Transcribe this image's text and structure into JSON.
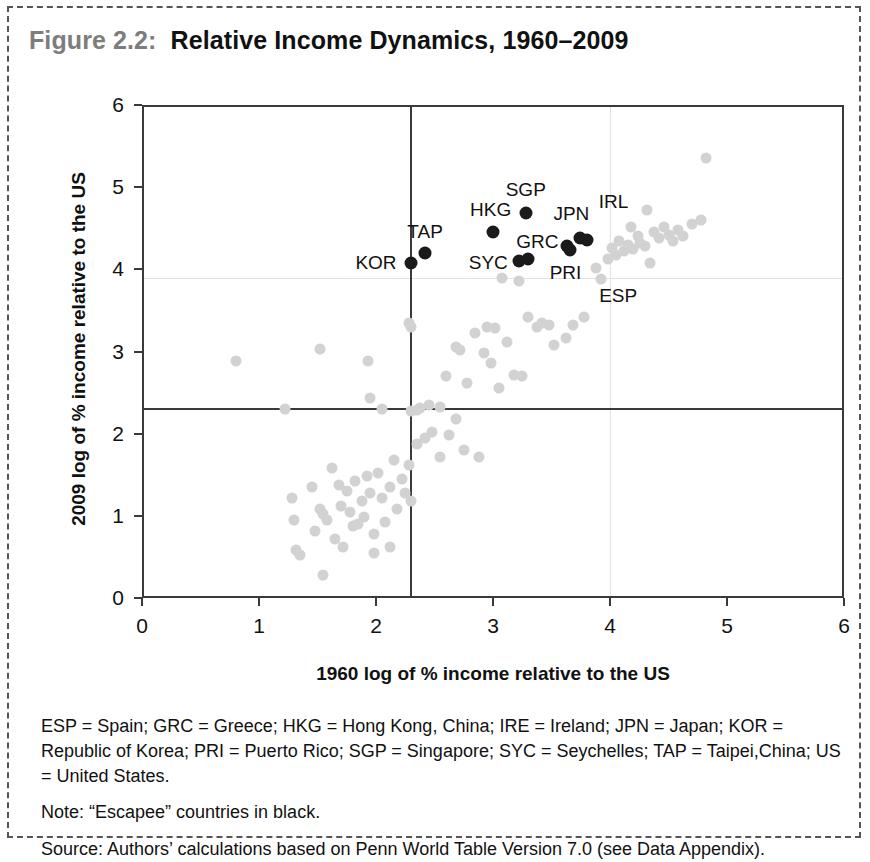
{
  "figure": {
    "number": "Figure 2.2:",
    "title": "Relative Income Dynamics, 1960–2009"
  },
  "notes": {
    "abbreviations": "ESP = Spain; GRC = Greece; HKG = Hong Kong, China; IRE = Ireland; JPN = Japan; KOR = Republic of Korea; PRI = Puerto Rico; SGP = Singapore; SYC = Seychelles; TAP = Taipei,China; US = United States.",
    "note": "Note: “Escapee” countries in black.",
    "source": "Source: Authors’ calculations based on Penn World Table Version 7.0 (see Data Appendix)."
  },
  "chart_data": {
    "type": "scatter",
    "title": "Relative Income Dynamics, 1960–2009",
    "xlabel": "1960 log of % income relative to the US",
    "ylabel": "2009 log of % income relative to the US",
    "xlim": [
      0,
      6
    ],
    "ylim": [
      0,
      6
    ],
    "xticks": [
      0,
      1,
      2,
      3,
      4,
      5,
      6
    ],
    "yticks": [
      0,
      1,
      2,
      3,
      4,
      5,
      6
    ],
    "grid": true,
    "legend": "none",
    "colors": {
      "escapee": "#1a1a1a",
      "other": "#d2d2d2",
      "axis": "#3a3a3a",
      "gridline": "#e2e2e2",
      "title_number": "#7d7d7d"
    },
    "reference_lines": [
      {
        "orientation": "vertical",
        "value": 2.3,
        "style": "solid",
        "color": "#3a3a3a"
      },
      {
        "orientation": "horizontal",
        "value": 2.3,
        "style": "solid",
        "color": "#3a3a3a"
      }
    ],
    "gridlines": [
      {
        "orientation": "vertical",
        "value": 4.0
      },
      {
        "orientation": "horizontal",
        "value": 3.9
      }
    ],
    "series": [
      {
        "name": "Escapee countries",
        "color": "#1a1a1a",
        "marker": "filled-circle",
        "points": [
          {
            "label": "KOR",
            "x": 2.3,
            "y": 4.08
          },
          {
            "label": "TAP",
            "x": 2.42,
            "y": 4.2
          },
          {
            "label": "HKG",
            "x": 3.0,
            "y": 4.45
          },
          {
            "label": "SGP",
            "x": 3.28,
            "y": 4.68
          },
          {
            "label": "SYC",
            "x": 3.22,
            "y": 4.1
          },
          {
            "label": "SYC",
            "x": 3.3,
            "y": 4.12
          },
          {
            "label": "GRC",
            "x": 3.63,
            "y": 4.29
          },
          {
            "label": "PRI",
            "x": 3.66,
            "y": 4.23
          },
          {
            "label": "JPN",
            "x": 3.74,
            "y": 4.38
          },
          {
            "label": "JPN",
            "x": 3.8,
            "y": 4.36
          }
        ]
      },
      {
        "name": "Other countries",
        "color": "#d2d2d2",
        "marker": "filled-circle",
        "points": [
          {
            "x": 0.8,
            "y": 2.88
          },
          {
            "x": 1.22,
            "y": 2.3
          },
          {
            "x": 1.52,
            "y": 3.03
          },
          {
            "x": 1.55,
            "y": 0.28
          },
          {
            "x": 1.93,
            "y": 2.88
          },
          {
            "x": 1.95,
            "y": 2.44
          },
          {
            "x": 2.05,
            "y": 2.3
          },
          {
            "x": 2.28,
            "y": 3.35
          },
          {
            "x": 2.3,
            "y": 3.3
          },
          {
            "x": 2.3,
            "y": 2.28
          },
          {
            "x": 2.35,
            "y": 2.29
          },
          {
            "x": 2.38,
            "y": 2.31
          },
          {
            "x": 2.45,
            "y": 2.35
          },
          {
            "x": 2.55,
            "y": 2.33
          },
          {
            "x": 2.6,
            "y": 2.7
          },
          {
            "x": 2.68,
            "y": 3.05
          },
          {
            "x": 2.72,
            "y": 3.02
          },
          {
            "x": 2.78,
            "y": 2.62
          },
          {
            "x": 2.85,
            "y": 3.22
          },
          {
            "x": 2.88,
            "y": 1.72
          },
          {
            "x": 2.92,
            "y": 2.98
          },
          {
            "x": 2.95,
            "y": 3.3
          },
          {
            "x": 2.98,
            "y": 2.86
          },
          {
            "x": 3.02,
            "y": 3.28
          },
          {
            "x": 3.05,
            "y": 2.55
          },
          {
            "x": 3.08,
            "y": 3.9
          },
          {
            "x": 3.12,
            "y": 3.12
          },
          {
            "x": 3.18,
            "y": 2.72
          },
          {
            "x": 3.22,
            "y": 3.86
          },
          {
            "x": 3.25,
            "y": 2.7
          },
          {
            "x": 3.3,
            "y": 3.42
          },
          {
            "x": 3.38,
            "y": 3.3
          },
          {
            "x": 3.42,
            "y": 3.35
          },
          {
            "x": 3.48,
            "y": 3.32
          },
          {
            "x": 3.52,
            "y": 3.08
          },
          {
            "x": 3.62,
            "y": 3.16
          },
          {
            "x": 3.68,
            "y": 3.32
          },
          {
            "x": 3.78,
            "y": 3.42
          },
          {
            "x": 3.88,
            "y": 4.02
          },
          {
            "x": 3.92,
            "y": 3.88
          },
          {
            "x": 3.98,
            "y": 4.12
          },
          {
            "x": 4.02,
            "y": 4.26
          },
          {
            "x": 4.05,
            "y": 4.18
          },
          {
            "x": 4.08,
            "y": 4.35
          },
          {
            "x": 4.12,
            "y": 4.22
          },
          {
            "x": 4.15,
            "y": 4.3
          },
          {
            "x": 4.18,
            "y": 4.52
          },
          {
            "x": 4.2,
            "y": 4.25
          },
          {
            "x": 4.24,
            "y": 4.4
          },
          {
            "x": 4.26,
            "y": 4.32
          },
          {
            "x": 4.3,
            "y": 4.28
          },
          {
            "x": 4.32,
            "y": 4.72
          },
          {
            "x": 4.34,
            "y": 4.08
          },
          {
            "x": 4.38,
            "y": 4.45
          },
          {
            "x": 4.42,
            "y": 4.38
          },
          {
            "x": 4.46,
            "y": 4.52
          },
          {
            "x": 4.5,
            "y": 4.42
          },
          {
            "x": 4.54,
            "y": 4.35
          },
          {
            "x": 4.58,
            "y": 4.48
          },
          {
            "x": 4.62,
            "y": 4.4
          },
          {
            "x": 4.7,
            "y": 4.55
          },
          {
            "x": 4.78,
            "y": 4.6
          },
          {
            "x": 4.82,
            "y": 5.35
          },
          {
            "x": 1.28,
            "y": 1.22
          },
          {
            "x": 1.3,
            "y": 0.95
          },
          {
            "x": 1.32,
            "y": 0.58
          },
          {
            "x": 1.35,
            "y": 0.52
          },
          {
            "x": 1.45,
            "y": 1.35
          },
          {
            "x": 1.48,
            "y": 0.82
          },
          {
            "x": 1.52,
            "y": 1.08
          },
          {
            "x": 1.55,
            "y": 1.02
          },
          {
            "x": 1.58,
            "y": 0.95
          },
          {
            "x": 1.62,
            "y": 1.58
          },
          {
            "x": 1.65,
            "y": 0.72
          },
          {
            "x": 1.68,
            "y": 1.38
          },
          {
            "x": 1.7,
            "y": 1.12
          },
          {
            "x": 1.72,
            "y": 0.62
          },
          {
            "x": 1.75,
            "y": 1.3
          },
          {
            "x": 1.78,
            "y": 1.05
          },
          {
            "x": 1.8,
            "y": 0.88
          },
          {
            "x": 1.82,
            "y": 1.42
          },
          {
            "x": 1.85,
            "y": 0.9
          },
          {
            "x": 1.88,
            "y": 1.18
          },
          {
            "x": 1.9,
            "y": 0.98
          },
          {
            "x": 1.92,
            "y": 1.48
          },
          {
            "x": 1.95,
            "y": 1.28
          },
          {
            "x": 1.98,
            "y": 0.78
          },
          {
            "x": 2.02,
            "y": 1.52
          },
          {
            "x": 2.05,
            "y": 1.22
          },
          {
            "x": 2.08,
            "y": 0.92
          },
          {
            "x": 2.12,
            "y": 1.35
          },
          {
            "x": 2.15,
            "y": 1.68
          },
          {
            "x": 2.18,
            "y": 1.08
          },
          {
            "x": 2.22,
            "y": 1.45
          },
          {
            "x": 2.25,
            "y": 1.28
          },
          {
            "x": 2.28,
            "y": 1.62
          },
          {
            "x": 2.3,
            "y": 1.18
          },
          {
            "x": 2.35,
            "y": 1.88
          },
          {
            "x": 2.42,
            "y": 1.95
          },
          {
            "x": 2.48,
            "y": 2.02
          },
          {
            "x": 2.55,
            "y": 1.72
          },
          {
            "x": 2.62,
            "y": 1.98
          },
          {
            "x": 2.68,
            "y": 2.18
          },
          {
            "x": 2.75,
            "y": 1.8
          },
          {
            "x": 1.98,
            "y": 0.55
          },
          {
            "x": 2.12,
            "y": 0.62
          }
        ]
      }
    ],
    "annotations": [
      {
        "text": "KOR",
        "x": 2.0,
        "y": 4.08
      },
      {
        "text": "TAP",
        "x": 2.42,
        "y": 4.46
      },
      {
        "text": "HKG",
        "x": 2.98,
        "y": 4.72
      },
      {
        "text": "SGP",
        "x": 3.28,
        "y": 4.96
      },
      {
        "text": "JPN",
        "x": 3.67,
        "y": 4.67
      },
      {
        "text": "SYC",
        "x": 2.96,
        "y": 4.08
      },
      {
        "text": "GRC",
        "x": 3.38,
        "y": 4.33
      },
      {
        "text": "PRI",
        "x": 3.62,
        "y": 3.95
      },
      {
        "text": "IRL",
        "x": 4.03,
        "y": 4.82
      },
      {
        "text": "ESP",
        "x": 4.07,
        "y": 3.68
      }
    ]
  }
}
